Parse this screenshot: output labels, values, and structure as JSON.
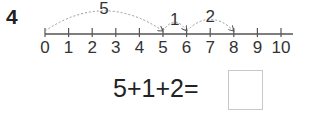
{
  "problem": {
    "number": "4",
    "equation": "5+1+2=",
    "answer_box": ""
  },
  "number_line": {
    "min": 0,
    "max": 10,
    "tick_labels": [
      "0",
      "1",
      "2",
      "3",
      "4",
      "5",
      "6",
      "7",
      "8",
      "9",
      "10"
    ],
    "jumps": [
      {
        "from": 0,
        "to": 5,
        "label": "5"
      },
      {
        "from": 5,
        "to": 6,
        "label": "1"
      },
      {
        "from": 6,
        "to": 8,
        "label": "2"
      }
    ]
  }
}
